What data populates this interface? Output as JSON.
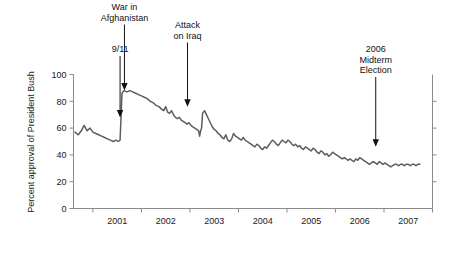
{
  "chart_data": {
    "type": "line",
    "title": "",
    "xlabel": "",
    "ylabel": "Percent approval of President Bush",
    "ylim": [
      0,
      100
    ],
    "xlim": [
      2000.6,
      2008.0
    ],
    "yticks": [
      0,
      20,
      40,
      60,
      80,
      100
    ],
    "ytick_labels": [
      "0",
      "20",
      "40",
      "60",
      "80",
      "100"
    ],
    "xticks": [
      2001,
      2002,
      2003,
      2004,
      2005,
      2006,
      2007,
      2008
    ],
    "xtick_labels": [
      "2001",
      "2002",
      "2003",
      "2004",
      "2005",
      "2006",
      "2007"
    ],
    "grid": false,
    "legend": "none",
    "line_color": "#5e5e5e",
    "axis_color": "#8a8a8a",
    "series": [
      {
        "name": "Presidential approval",
        "points": [
          [
            2000.63,
            57
          ],
          [
            2000.7,
            55
          ],
          [
            2000.76,
            58
          ],
          [
            2000.82,
            62
          ],
          [
            2000.88,
            58
          ],
          [
            2000.94,
            60
          ],
          [
            2001.0,
            57
          ],
          [
            2001.06,
            56
          ],
          [
            2001.12,
            55
          ],
          [
            2001.18,
            54
          ],
          [
            2001.24,
            53
          ],
          [
            2001.3,
            52
          ],
          [
            2001.36,
            51
          ],
          [
            2001.42,
            50
          ],
          [
            2001.48,
            51
          ],
          [
            2001.52,
            50
          ],
          [
            2001.56,
            51
          ],
          [
            2001.6,
            86
          ],
          [
            2001.64,
            88
          ],
          [
            2001.7,
            87
          ],
          [
            2001.76,
            88
          ],
          [
            2001.82,
            87
          ],
          [
            2001.88,
            86
          ],
          [
            2001.94,
            85
          ],
          [
            2002.0,
            84
          ],
          [
            2002.06,
            83
          ],
          [
            2002.12,
            82
          ],
          [
            2002.18,
            80
          ],
          [
            2002.24,
            79
          ],
          [
            2002.3,
            77
          ],
          [
            2002.36,
            76
          ],
          [
            2002.42,
            74
          ],
          [
            2002.46,
            73
          ],
          [
            2002.5,
            76
          ],
          [
            2002.54,
            72
          ],
          [
            2002.58,
            71
          ],
          [
            2002.62,
            73
          ],
          [
            2002.66,
            70
          ],
          [
            2002.7,
            68
          ],
          [
            2002.74,
            67
          ],
          [
            2002.78,
            68
          ],
          [
            2002.82,
            66
          ],
          [
            2002.86,
            65
          ],
          [
            2002.9,
            64
          ],
          [
            2002.94,
            63
          ],
          [
            2002.98,
            64
          ],
          [
            2003.02,
            62
          ],
          [
            2003.06,
            61
          ],
          [
            2003.1,
            60
          ],
          [
            2003.14,
            59
          ],
          [
            2003.18,
            58
          ],
          [
            2003.2,
            54
          ],
          [
            2003.22,
            58
          ],
          [
            2003.24,
            60
          ],
          [
            2003.26,
            71
          ],
          [
            2003.3,
            73
          ],
          [
            2003.34,
            70
          ],
          [
            2003.38,
            67
          ],
          [
            2003.42,
            64
          ],
          [
            2003.46,
            61
          ],
          [
            2003.5,
            59
          ],
          [
            2003.54,
            58
          ],
          [
            2003.58,
            56
          ],
          [
            2003.62,
            55
          ],
          [
            2003.66,
            53
          ],
          [
            2003.7,
            52
          ],
          [
            2003.74,
            55
          ],
          [
            2003.78,
            51
          ],
          [
            2003.82,
            50
          ],
          [
            2003.86,
            52
          ],
          [
            2003.9,
            56
          ],
          [
            2003.94,
            54
          ],
          [
            2003.98,
            53
          ],
          [
            2004.02,
            52
          ],
          [
            2004.06,
            51
          ],
          [
            2004.1,
            53
          ],
          [
            2004.14,
            51
          ],
          [
            2004.18,
            50
          ],
          [
            2004.22,
            49
          ],
          [
            2004.26,
            48
          ],
          [
            2004.3,
            47
          ],
          [
            2004.34,
            46
          ],
          [
            2004.38,
            48
          ],
          [
            2004.42,
            47
          ],
          [
            2004.46,
            45
          ],
          [
            2004.5,
            44
          ],
          [
            2004.54,
            46
          ],
          [
            2004.58,
            45
          ],
          [
            2004.62,
            47
          ],
          [
            2004.66,
            49
          ],
          [
            2004.7,
            51
          ],
          [
            2004.74,
            50
          ],
          [
            2004.78,
            48
          ],
          [
            2004.82,
            47
          ],
          [
            2004.86,
            49
          ],
          [
            2004.9,
            51
          ],
          [
            2004.94,
            50
          ],
          [
            2004.98,
            49
          ],
          [
            2005.02,
            51
          ],
          [
            2005.06,
            50
          ],
          [
            2005.1,
            48
          ],
          [
            2005.14,
            47
          ],
          [
            2005.18,
            48
          ],
          [
            2005.22,
            46
          ],
          [
            2005.26,
            47
          ],
          [
            2005.3,
            45
          ],
          [
            2005.34,
            44
          ],
          [
            2005.38,
            46
          ],
          [
            2005.42,
            45
          ],
          [
            2005.46,
            44
          ],
          [
            2005.5,
            43
          ],
          [
            2005.54,
            45
          ],
          [
            2005.58,
            44
          ],
          [
            2005.62,
            42
          ],
          [
            2005.66,
            41
          ],
          [
            2005.7,
            43
          ],
          [
            2005.74,
            42
          ],
          [
            2005.78,
            40
          ],
          [
            2005.82,
            41
          ],
          [
            2005.86,
            39
          ],
          [
            2005.9,
            40
          ],
          [
            2005.94,
            42
          ],
          [
            2005.98,
            41
          ],
          [
            2006.02,
            40
          ],
          [
            2006.06,
            39
          ],
          [
            2006.1,
            38
          ],
          [
            2006.14,
            37
          ],
          [
            2006.18,
            38
          ],
          [
            2006.22,
            37
          ],
          [
            2006.26,
            36
          ],
          [
            2006.3,
            37
          ],
          [
            2006.34,
            36
          ],
          [
            2006.38,
            35
          ],
          [
            2006.42,
            37
          ],
          [
            2006.46,
            36
          ],
          [
            2006.5,
            38
          ],
          [
            2006.54,
            37
          ],
          [
            2006.58,
            36
          ],
          [
            2006.62,
            35
          ],
          [
            2006.66,
            34
          ],
          [
            2006.7,
            33
          ],
          [
            2006.74,
            34
          ],
          [
            2006.78,
            35
          ],
          [
            2006.82,
            34
          ],
          [
            2006.86,
            33
          ],
          [
            2006.9,
            35
          ],
          [
            2006.94,
            34
          ],
          [
            2006.98,
            33
          ],
          [
            2007.02,
            34
          ],
          [
            2007.06,
            33
          ],
          [
            2007.1,
            32
          ],
          [
            2007.14,
            31
          ],
          [
            2007.18,
            32
          ],
          [
            2007.22,
            33
          ],
          [
            2007.26,
            33
          ],
          [
            2007.3,
            32
          ],
          [
            2007.34,
            33
          ],
          [
            2007.38,
            33
          ],
          [
            2007.42,
            32
          ],
          [
            2007.46,
            33
          ],
          [
            2007.5,
            33
          ],
          [
            2007.54,
            32
          ],
          [
            2007.58,
            33
          ],
          [
            2007.62,
            33
          ],
          [
            2007.66,
            32
          ],
          [
            2007.7,
            33
          ],
          [
            2007.74,
            33
          ]
        ]
      }
    ],
    "annotations": [
      {
        "id": "nine-eleven",
        "label": "9/11",
        "lines": [
          "9/11"
        ],
        "x": 2001.56,
        "y": 68
      },
      {
        "id": "war-afghanistan",
        "label": "War in Afghanistan",
        "lines": [
          "War in",
          "Afghanistan"
        ],
        "x": 2001.65,
        "y": 88
      },
      {
        "id": "attack-iraq",
        "label": "Attack on Iraq",
        "lines": [
          "Attack",
          "on Iraq"
        ],
        "x": 2002.95,
        "y": 76
      },
      {
        "id": "midterm-2006",
        "label": "2006 Midterm Election",
        "lines": [
          "2006",
          "Midterm",
          "Election"
        ],
        "x": 2006.83,
        "y": 46
      }
    ]
  }
}
